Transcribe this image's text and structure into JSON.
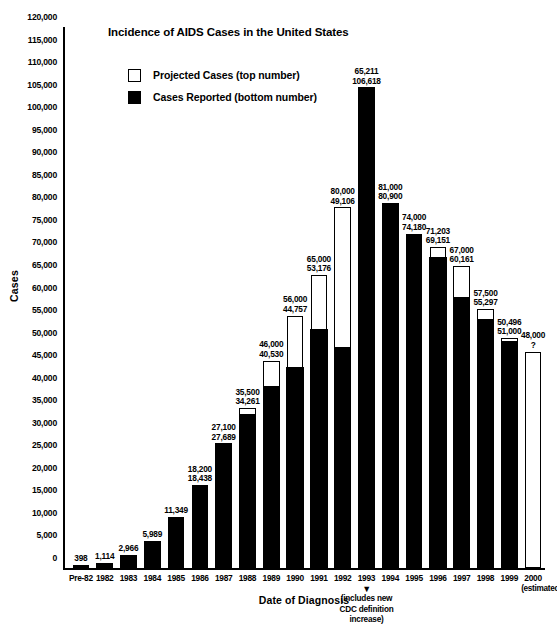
{
  "title": "Incidence of AIDS Cases in the United States",
  "legend": [
    {
      "swatch": "hollow",
      "label": "Projected Cases (top number)"
    },
    {
      "swatch": "filled",
      "label": "Cases Reported (bottom number)"
    }
  ],
  "axes": {
    "y_title": "Cases",
    "x_title": "Date of Diagnosis",
    "y_ticks": [
      "0",
      "5,000",
      "10,000",
      "15,000",
      "20,000",
      "25,000",
      "30,000",
      "35,000",
      "40,000",
      "45,000",
      "50,000",
      "55,000",
      "60,000",
      "65,000",
      "70,000",
      "75,000",
      "80,000",
      "85,000",
      "90,000",
      "95,000",
      "100,000",
      "105,000",
      "110,000",
      "115,000",
      "120,000"
    ]
  },
  "annotation": {
    "arrow": "▼",
    "line1": "(includes new",
    "line2": "CDC definition",
    "line3": "increase)"
  },
  "chart_data": {
    "type": "bar",
    "title": "Incidence of AIDS Cases in the United States",
    "xlabel": "Date of Diagnosis",
    "ylabel": "Cases",
    "ylim": [
      0,
      120000
    ],
    "ytick_step": 5000,
    "grid": false,
    "legend_position": "top-left-inside",
    "categories": [
      "Pre-82",
      "1982",
      "1983",
      "1984",
      "1985",
      "1986",
      "1987",
      "1988",
      "1989",
      "1990",
      "1991",
      "1992",
      "1993",
      "1994",
      "1995",
      "1996",
      "1997",
      "1998",
      "1999",
      "2000"
    ],
    "series": [
      {
        "name": "Projected Cases (top number)",
        "style": "hollow",
        "values": [
          null,
          null,
          null,
          null,
          null,
          18200,
          27100,
          35500,
          46000,
          56000,
          65000,
          80000,
          65211,
          81000,
          74000,
          71203,
          67000,
          57500,
          50496,
          48000
        ]
      },
      {
        "name": "Cases Reported (bottom number)",
        "style": "filled",
        "values": [
          398,
          1114,
          2966,
          5989,
          11349,
          18438,
          27689,
          34261,
          40530,
          44757,
          53176,
          49106,
          106618,
          80900,
          74180,
          69151,
          60161,
          55297,
          51000,
          null
        ]
      }
    ],
    "bars": [
      {
        "category": "Pre-82",
        "top_label": "398",
        "bottom_label": "",
        "bar_top": 398,
        "reported": 398,
        "hollow": false,
        "sub_label": ""
      },
      {
        "category": "1982",
        "top_label": "1,114",
        "bottom_label": "",
        "bar_top": 1114,
        "reported": 1114,
        "hollow": false,
        "sub_label": ""
      },
      {
        "category": "1983",
        "top_label": "2,966",
        "bottom_label": "",
        "bar_top": 2966,
        "reported": 2966,
        "hollow": false,
        "sub_label": ""
      },
      {
        "category": "1984",
        "top_label": "5,989",
        "bottom_label": "",
        "bar_top": 5989,
        "reported": 5989,
        "hollow": false,
        "sub_label": ""
      },
      {
        "category": "1985",
        "top_label": "11,349",
        "bottom_label": "",
        "bar_top": 11349,
        "reported": 11349,
        "hollow": false,
        "sub_label": ""
      },
      {
        "category": "1986",
        "top_label": "18,200",
        "bottom_label": "18,438",
        "bar_top": 18438,
        "reported": 18438,
        "hollow": false,
        "sub_label": ""
      },
      {
        "category": "1987",
        "top_label": "27,100",
        "bottom_label": "27,689",
        "bar_top": 27689,
        "reported": 27689,
        "hollow": false,
        "sub_label": ""
      },
      {
        "category": "1988",
        "top_label": "35,500",
        "bottom_label": "34,261",
        "bar_top": 35500,
        "reported": 34261,
        "hollow": false,
        "sub_label": ""
      },
      {
        "category": "1989",
        "top_label": "46,000",
        "bottom_label": "40,530",
        "bar_top": 46000,
        "reported": 40530,
        "hollow": false,
        "sub_label": ""
      },
      {
        "category": "1990",
        "top_label": "56,000",
        "bottom_label": "44,757",
        "bar_top": 56000,
        "reported": 44757,
        "hollow": false,
        "sub_label": ""
      },
      {
        "category": "1991",
        "top_label": "65,000",
        "bottom_label": "53,176",
        "bar_top": 65000,
        "reported": 53176,
        "hollow": false,
        "sub_label": ""
      },
      {
        "category": "1992",
        "top_label": "80,000",
        "bottom_label": "49,106",
        "bar_top": 80000,
        "reported": 49106,
        "hollow": false,
        "sub_label": ""
      },
      {
        "category": "1993",
        "top_label": "65,211",
        "bottom_label": "106,618",
        "bar_top": 106618,
        "reported": 106618,
        "hollow": false,
        "sub_label": ""
      },
      {
        "category": "1994",
        "top_label": "81,000",
        "bottom_label": "80,900",
        "bar_top": 81000,
        "reported": 80900,
        "hollow": false,
        "sub_label": ""
      },
      {
        "category": "1995",
        "top_label": "74,000",
        "bottom_label": "74,180",
        "bar_top": 74180,
        "reported": 74180,
        "hollow": false,
        "sub_label": ""
      },
      {
        "category": "1996",
        "top_label": "71,203",
        "bottom_label": "69,151",
        "bar_top": 71203,
        "reported": 69151,
        "hollow": false,
        "sub_label": ""
      },
      {
        "category": "1997",
        "top_label": "67,000",
        "bottom_label": "60,161",
        "bar_top": 67000,
        "reported": 60161,
        "hollow": false,
        "sub_label": ""
      },
      {
        "category": "1998",
        "top_label": "57,500",
        "bottom_label": "55,297",
        "bar_top": 57500,
        "reported": 55297,
        "hollow": false,
        "sub_label": ""
      },
      {
        "category": "1999",
        "top_label": "50,496",
        "bottom_label": "51,000",
        "bar_top": 51000,
        "reported": 50496,
        "hollow": false,
        "sub_label": ""
      },
      {
        "category": "2000",
        "top_label": "48,000",
        "bottom_label": "?",
        "bar_top": 48000,
        "reported": 0,
        "hollow": true,
        "sub_label": "(estimated)"
      }
    ]
  }
}
